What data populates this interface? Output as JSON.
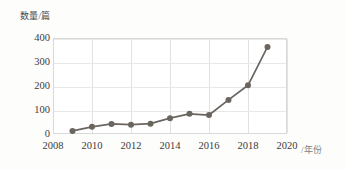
{
  "chart_data": {
    "type": "line",
    "title": "",
    "xlabel": "/年份",
    "ylabel": "数量/篇",
    "x": [
      2009,
      2010,
      2011,
      2012,
      2013,
      2014,
      2015,
      2016,
      2017,
      2018,
      2019
    ],
    "values": [
      13,
      30,
      42,
      39,
      43,
      66,
      84,
      79,
      142,
      203,
      363
    ],
    "series": [
      {
        "name": "数量/篇",
        "values": [
          13,
          30,
          42,
          39,
          43,
          66,
          84,
          79,
          142,
          203,
          363
        ]
      }
    ],
    "xlim": [
      2008,
      2020
    ],
    "ylim": [
      0,
      400
    ],
    "x_ticks": [
      "2008",
      "2010",
      "2012",
      "2014",
      "2016",
      "2018",
      "2020"
    ],
    "x_tick_values": [
      2008,
      2010,
      2012,
      2014,
      2016,
      2018,
      2020
    ],
    "y_ticks": [
      "0",
      "100",
      "200",
      "300",
      "400"
    ],
    "y_tick_values": [
      0,
      100,
      200,
      300,
      400
    ],
    "grid": true,
    "legend": false,
    "legend_position": "none",
    "marker": "circle",
    "colors": {
      "line": "#6b6560",
      "marker": "#6b6560",
      "grid": "#e2e2e2",
      "axis": "#d9d9d9",
      "text": "#3b3b3b",
      "background": "#fdfdfc",
      "plot_background": "#ffffff"
    }
  },
  "axes": {
    "y_title": "数量/篇",
    "x_title": "/年份"
  }
}
